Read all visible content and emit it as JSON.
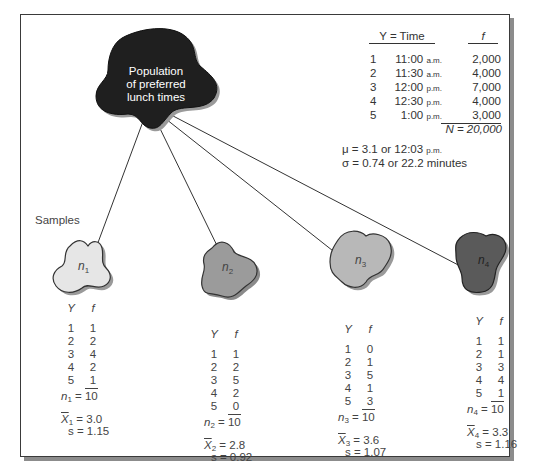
{
  "population": {
    "label_lines": [
      "Population",
      "of preferred",
      "lunch times"
    ],
    "color": "#1f1f1f"
  },
  "population_table": {
    "header_y": "Y = Time",
    "header_f": "f",
    "rows": [
      {
        "y": "1",
        "time": "11:00",
        "ampm": "a.m.",
        "f": "2,000"
      },
      {
        "y": "2",
        "time": "11:30",
        "ampm": "a.m.",
        "f": "4,000"
      },
      {
        "y": "3",
        "time": "12:00",
        "ampm": "p.m.",
        "f": "7,000"
      },
      {
        "y": "4",
        "time": "12:30",
        "ampm": "p.m.",
        "f": "4,000"
      },
      {
        "y": "5",
        "time": "1:00",
        "ampm": "p.m.",
        "f": "3,000"
      }
    ],
    "total": "N = 20,000",
    "mu_text": "μ = 3.1 or 12:03",
    "mu_ampm": "p.m.",
    "sigma_text": "σ = 0.74 or 22.2 minutes"
  },
  "samples_label": "Samples",
  "samples": [
    {
      "name": "n",
      "index": "1",
      "color": "#e6e6e6",
      "header_y": "Y",
      "header_f": "f",
      "rows": [
        [
          "1",
          "1"
        ],
        [
          "2",
          "2"
        ],
        [
          "3",
          "4"
        ],
        [
          "4",
          "2"
        ],
        [
          "5",
          "1"
        ]
      ],
      "n_label": "n",
      "n_total": "10",
      "xbar_label": "X",
      "xbar_value": "= 3.0",
      "s_value": "s = 1.15"
    },
    {
      "name": "n",
      "index": "2",
      "color": "#9b9b9b",
      "header_y": "Y",
      "header_f": "f",
      "rows": [
        [
          "1",
          "1"
        ],
        [
          "2",
          "2"
        ],
        [
          "3",
          "5"
        ],
        [
          "4",
          "2"
        ],
        [
          "5",
          "0"
        ]
      ],
      "n_label": "n",
      "n_total": "10",
      "xbar_label": "X",
      "xbar_value": "= 2.8",
      "s_value": "s = 0.92"
    },
    {
      "name": "n",
      "index": "3",
      "color": "#b8b8b8",
      "header_y": "Y",
      "header_f": "f",
      "rows": [
        [
          "1",
          "0"
        ],
        [
          "2",
          "1"
        ],
        [
          "3",
          "5"
        ],
        [
          "4",
          "1"
        ],
        [
          "5",
          "3"
        ]
      ],
      "n_label": "n",
      "n_total": "10",
      "xbar_label": "X",
      "xbar_value": "= 3.6",
      "s_value": "s = 1.07"
    },
    {
      "name": "n",
      "index": "4",
      "color": "#5a5a5a",
      "header_y": "Y",
      "header_f": "f",
      "rows": [
        [
          "1",
          "1"
        ],
        [
          "2",
          "1"
        ],
        [
          "3",
          "3"
        ],
        [
          "4",
          "4"
        ],
        [
          "5",
          "1"
        ]
      ],
      "n_label": "n",
      "n_total": "10",
      "xbar_label": "X",
      "xbar_value": "= 3.3",
      "s_value": "s = 1.16"
    }
  ]
}
